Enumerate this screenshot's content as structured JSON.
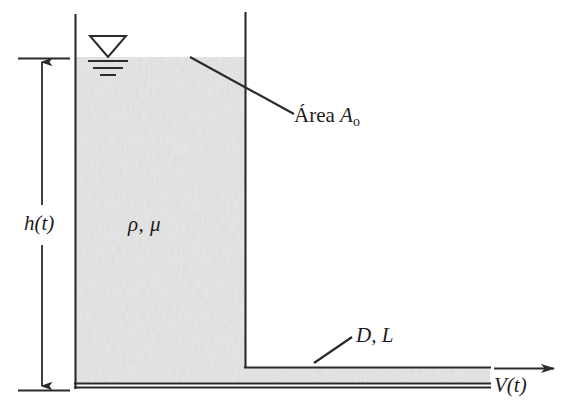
{
  "figure": {
    "background_color": "#ffffff",
    "line_color": "#2b2b2b",
    "fluid_fill_color": "#e4e4e4",
    "labels": {
      "height": "h(t)",
      "fluid_props": "ρ, μ",
      "area_prefix": "Área ",
      "area_symbol": "A",
      "area_subscript": "o",
      "pipe": "D, L",
      "velocity": "V(t)"
    },
    "icons": {
      "free_surface": "free-surface-icon",
      "height_dimension": "dimension-arrow-icon",
      "velocity_arrow": "velocity-arrow-icon",
      "leader_area": "leader-line-icon",
      "leader_pipe": "leader-line-icon"
    },
    "geometry": {
      "tank_left_x": 75,
      "tank_right_x": 245,
      "tank_top_y": 14,
      "tank_bottom_y": 388,
      "water_surface_y": 57,
      "pipe_top_y": 367,
      "pipe_bottom_y": 383,
      "pipe_exit_x": 490,
      "velocity_arrow_y": 368,
      "velocity_arrow_end_x": 556,
      "dimension_x": 42,
      "dimension_top_y": 58,
      "dimension_bottom_y": 390
    }
  }
}
